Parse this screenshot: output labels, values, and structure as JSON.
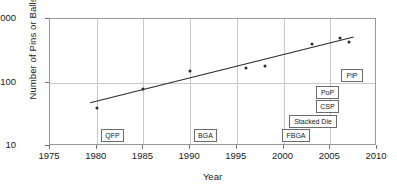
{
  "chart_data": {
    "type": "scatter",
    "title": "",
    "xlabel": "Year",
    "ylabel": "Number of Pins or Balls",
    "xlim": [
      1975,
      2010
    ],
    "ylim": [
      10,
      1000
    ],
    "yscale": "log",
    "xticks": [
      "1975",
      "1980",
      "1985",
      "1990",
      "1995",
      "2000",
      "2005",
      "2010"
    ],
    "xtick_values": [
      1975,
      1980,
      1985,
      1990,
      1995,
      2000,
      2005,
      2010
    ],
    "yticks": [
      "10",
      "100",
      "1000"
    ],
    "ytick_values": [
      10,
      100,
      1000
    ],
    "grid": true,
    "legend": "none",
    "series": [
      {
        "name": "Pins or Balls",
        "points": [
          {
            "x": 1980,
            "y": 40
          },
          {
            "x": 1985,
            "y": 78
          },
          {
            "x": 1990,
            "y": 150
          },
          {
            "x": 1996,
            "y": 170
          },
          {
            "x": 1998,
            "y": 185
          },
          {
            "x": 2003,
            "y": 400
          },
          {
            "x": 2006,
            "y": 500
          },
          {
            "x": 2007,
            "y": 430
          }
        ]
      }
    ],
    "trendline": {
      "name": "linear fit (log scale)",
      "x_start": 1979.3,
      "y_start": 48,
      "x_end": 2007.5,
      "y_end": 520
    },
    "annotations": [
      {
        "label": "QFP",
        "x_px": 100,
        "y_px": 128,
        "w_px": 23
      },
      {
        "label": "BGA",
        "x_px": 193,
        "y_px": 128,
        "w_px": 23
      },
      {
        "label": "FBGA",
        "x_px": 281,
        "y_px": 128,
        "w_px": 28
      },
      {
        "label": "Stacked Die",
        "x_px": 288,
        "y_px": 114,
        "w_px": 48
      },
      {
        "label": "CSP",
        "x_px": 315,
        "y_px": 99,
        "w_px": 23
      },
      {
        "label": "PoP",
        "x_px": 315,
        "y_px": 85,
        "w_px": 23
      },
      {
        "label": "PiP",
        "x_px": 340,
        "y_px": 68,
        "w_px": 22
      }
    ]
  }
}
